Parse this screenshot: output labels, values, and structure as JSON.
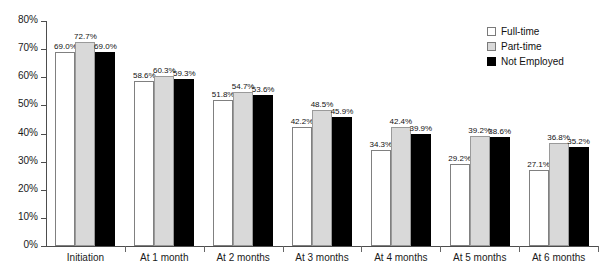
{
  "chart_data": {
    "type": "bar",
    "title": "",
    "subtitle": "",
    "xlabel": "",
    "ylabel": "",
    "ylim": [
      0,
      80
    ],
    "ytick_labels": [
      "80%",
      "70%",
      "60%",
      "50%",
      "40%",
      "30%",
      "20%",
      "10%",
      "0%"
    ],
    "ytick_values": [
      80,
      70,
      60,
      50,
      40,
      30,
      20,
      10,
      0
    ],
    "grid": false,
    "legend_position": "top-right",
    "categories": [
      "Initiation",
      "At 1 month",
      "At 2 months",
      "At 3 months",
      "At 4 months",
      "At 5 months",
      "At 6 months"
    ],
    "series": [
      {
        "name": "Full-time",
        "color": "#ffffff",
        "values": [
          69.0,
          58.6,
          51.8,
          42.2,
          34.3,
          29.2,
          27.1
        ],
        "labels": [
          "69.0%",
          "58.6%",
          "51.8%",
          "42.2%",
          "34.3%",
          "29.2%",
          "27.1%"
        ]
      },
      {
        "name": "Part-time",
        "color": "#d9d9d9",
        "values": [
          72.7,
          60.3,
          54.7,
          48.5,
          42.4,
          39.2,
          36.8
        ],
        "labels": [
          "72.7%",
          "60.3%",
          "54.7%",
          "48.5%",
          "42.4%",
          "39.2%",
          "36.8%"
        ]
      },
      {
        "name": "Not Employed",
        "color": "#000000",
        "values": [
          69.0,
          59.3,
          53.6,
          45.9,
          39.9,
          38.6,
          35.2
        ],
        "labels": [
          "69.0%",
          "59.3%",
          "53.6%",
          "45.9%",
          "39.9%",
          "38.6%",
          "35.2%"
        ]
      }
    ]
  },
  "legend": {
    "items": [
      {
        "label": "Full-time",
        "swatch": "full-time"
      },
      {
        "label": "Part-time",
        "swatch": "part-time"
      },
      {
        "label": "Not Employed",
        "swatch": "not-employed"
      }
    ]
  }
}
